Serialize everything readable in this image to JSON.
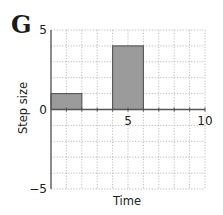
{
  "panel_label": "G",
  "chart_data": {
    "type": "bar",
    "title": "",
    "xlabel": "Time",
    "ylabel": "Step size",
    "xlim": [
      0,
      10
    ],
    "ylim": [
      -5,
      5
    ],
    "grid": true,
    "grid_style": "dotted",
    "x_ticks": [
      5,
      10
    ],
    "x_tick_labels": [
      "5",
      "10"
    ],
    "y_ticks": [
      -5,
      0,
      5
    ],
    "y_tick_labels": [
      "−5",
      "0",
      "5"
    ],
    "bars": [
      {
        "x_start": 0,
        "x_end": 2,
        "value": 1
      },
      {
        "x_start": 4,
        "x_end": 6,
        "value": 4
      }
    ],
    "categories": [
      "0-2",
      "4-6"
    ],
    "values": [
      1,
      4
    ],
    "colors": {
      "bar_fill": "#9b9b9b",
      "bar_edge": "#555555",
      "axis": "#555555",
      "grid": "#b5b5b5"
    }
  }
}
